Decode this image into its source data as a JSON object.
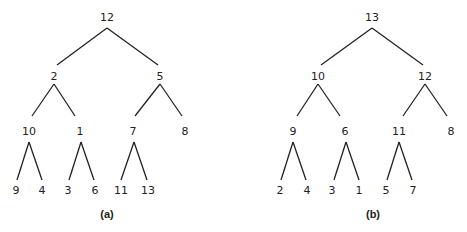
{
  "trees": [
    {
      "caption": "(a)",
      "nodes": [
        {
          "id": "a0",
          "label": "12",
          "x": 107,
          "y": 21
        },
        {
          "id": "a1",
          "label": "2",
          "x": 54,
          "y": 80
        },
        {
          "id": "a2",
          "label": "5",
          "x": 160,
          "y": 80
        },
        {
          "id": "a3",
          "label": "10",
          "x": 29,
          "y": 135
        },
        {
          "id": "a4",
          "label": "1",
          "x": 80,
          "y": 135
        },
        {
          "id": "a5",
          "label": "7",
          "x": 133,
          "y": 135
        },
        {
          "id": "a6",
          "label": "8",
          "x": 185,
          "y": 135
        },
        {
          "id": "a7",
          "label": "9",
          "x": 16,
          "y": 194
        },
        {
          "id": "a8",
          "label": "4",
          "x": 42,
          "y": 194
        },
        {
          "id": "a9",
          "label": "3",
          "x": 68,
          "y": 194
        },
        {
          "id": "a10",
          "label": "6",
          "x": 95,
          "y": 194
        },
        {
          "id": "a11",
          "label": "11",
          "x": 121,
          "y": 194
        },
        {
          "id": "a12",
          "label": "13",
          "x": 148,
          "y": 194
        }
      ],
      "caption_x": 107
    },
    {
      "caption": "(b)",
      "nodes": [
        {
          "id": "b0",
          "label": "13",
          "x": 372,
          "y": 21
        },
        {
          "id": "b1",
          "label": "10",
          "x": 318,
          "y": 80
        },
        {
          "id": "b2",
          "label": "12",
          "x": 425,
          "y": 80
        },
        {
          "id": "b3",
          "label": "9",
          "x": 293,
          "y": 135
        },
        {
          "id": "b4",
          "label": "6",
          "x": 344,
          "y": 135
        },
        {
          "id": "b5",
          "label": "11",
          "x": 399,
          "y": 135
        },
        {
          "id": "b6",
          "label": "8",
          "x": 451,
          "y": 135
        },
        {
          "id": "b7",
          "label": "2",
          "x": 280,
          "y": 194
        },
        {
          "id": "b8",
          "label": "4",
          "x": 307,
          "y": 194
        },
        {
          "id": "b9",
          "label": "3",
          "x": 332,
          "y": 194
        },
        {
          "id": "b10",
          "label": "1",
          "x": 359,
          "y": 194
        },
        {
          "id": "b11",
          "label": "5",
          "x": 386,
          "y": 194
        },
        {
          "id": "b12",
          "label": "7",
          "x": 413,
          "y": 194
        }
      ],
      "caption_x": 373
    }
  ]
}
